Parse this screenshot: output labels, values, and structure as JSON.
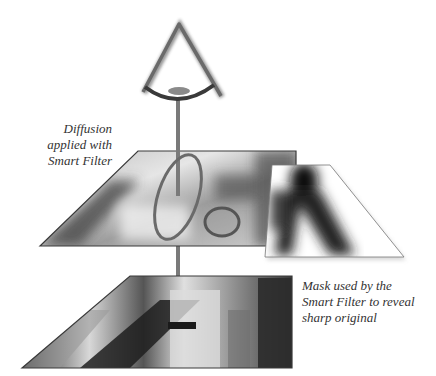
{
  "diagram": {
    "captions": {
      "diffusion": [
        "Diffusion",
        "applied with",
        "Smart Filter"
      ],
      "mask": [
        "Mask used by the",
        "Smart Filter to reveal",
        "sharp original"
      ]
    },
    "elements": {
      "eye": "eye-viewpoint-icon",
      "sight_line": "sight-line",
      "top_layer": "diffused-photo-layer",
      "mask_layer": "smart-filter-mask",
      "bottom_layer": "sharp-original-photo-layer",
      "loupe": "oval-loupe-ring",
      "small_loupe": "small-lens-ring"
    },
    "colors": {
      "background": "#ffffff",
      "caption_text": "#333333",
      "eye_stroke": "#6a6a6a",
      "sight_line": "#7a7a7a",
      "layer_border": "#3a3a3a"
    }
  }
}
